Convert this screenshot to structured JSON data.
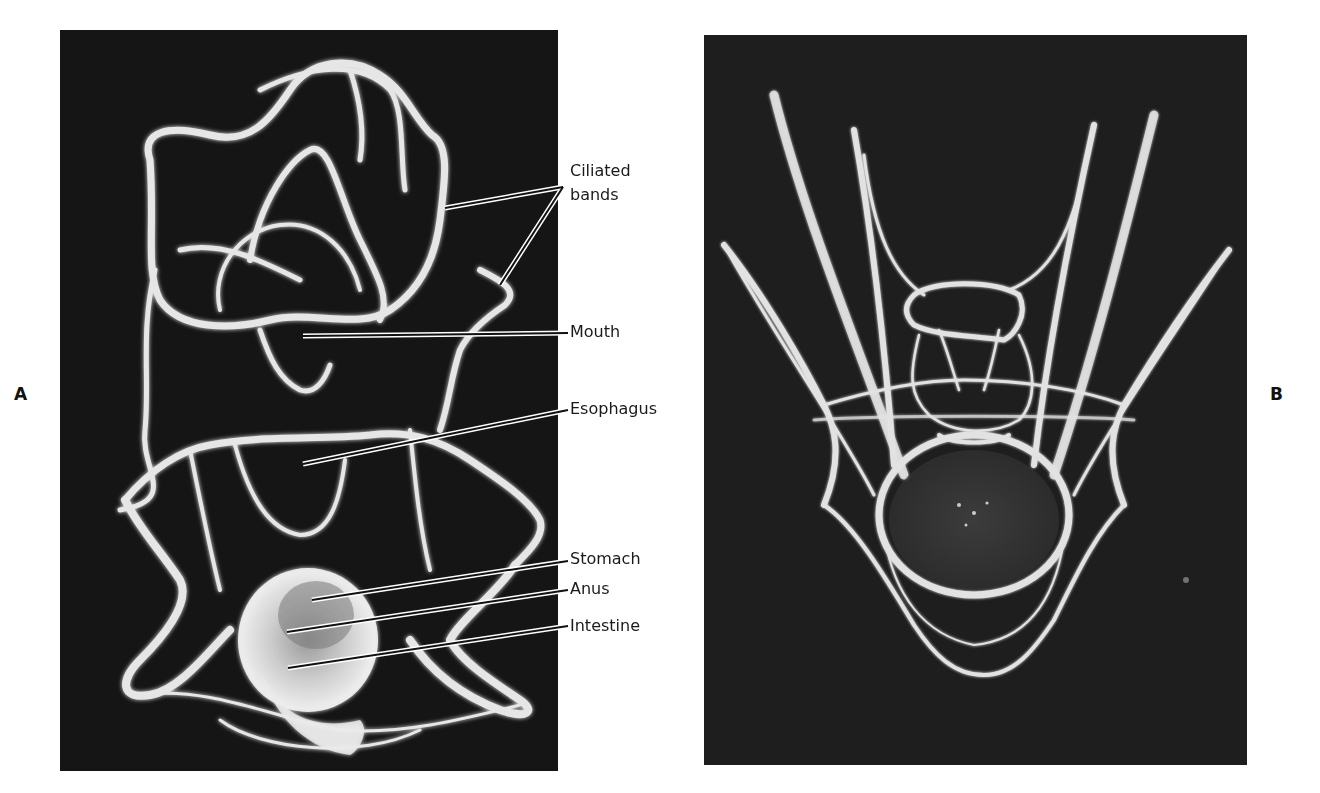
{
  "figure": {
    "panels": [
      {
        "id": "A",
        "letter": "A",
        "description": "Larva with ciliated bands, labeled anatomy"
      },
      {
        "id": "B",
        "letter": "B",
        "description": "Pluteus larva with elongated arms"
      }
    ],
    "labels": {
      "ciliated_line1": "Ciliated",
      "ciliated_line2": "bands",
      "mouth": "Mouth",
      "esophagus": "Esophagus",
      "stomach": "Stomach",
      "anus": "Anus",
      "intestine": "Intestine"
    },
    "colors": {
      "panel_background": "#151515",
      "structure_glow": "#e8e8e8",
      "label_text": "#1a1a1a",
      "page_background": "#ffffff"
    }
  }
}
